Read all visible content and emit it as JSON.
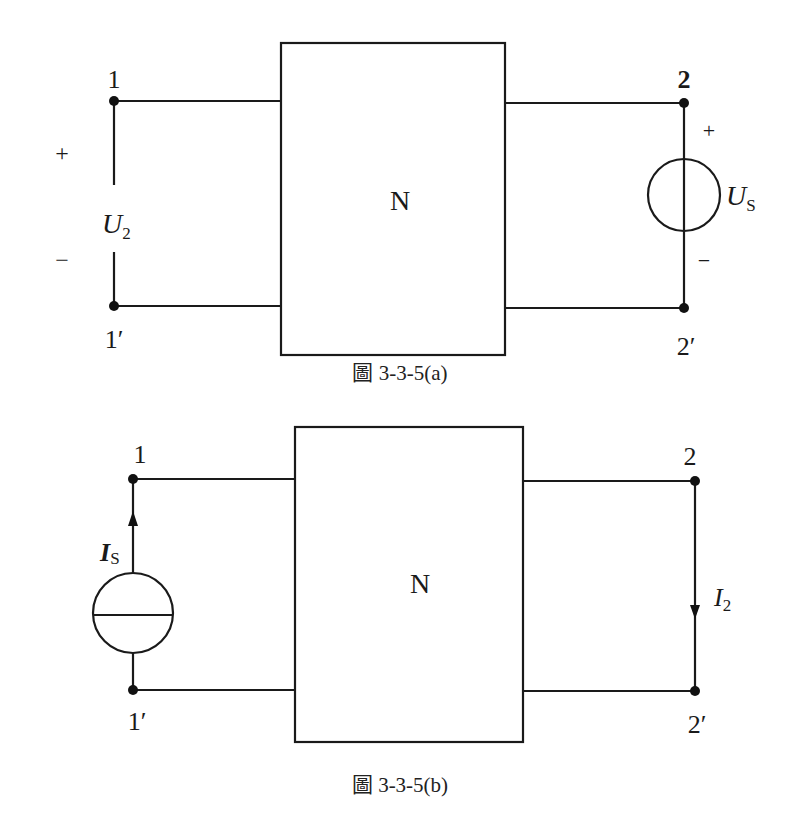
{
  "figures": [
    {
      "id": "a",
      "caption": "圖 3-3-5(a)",
      "network_label": "N",
      "terminals": {
        "left_top": "1",
        "left_bottom": "1′",
        "right_top": "2",
        "right_bottom": "2′"
      },
      "left_port": {
        "type": "open-circuit voltage",
        "plus": "+",
        "minus": "−",
        "symbol": "U",
        "subscript": "2"
      },
      "right_port": {
        "type": "voltage source",
        "plus": "+",
        "minus": "−",
        "symbol": "U",
        "subscript": "S"
      }
    },
    {
      "id": "b",
      "caption": "圖 3-3-5(b)",
      "network_label": "N",
      "terminals": {
        "left_top": "1",
        "left_bottom": "1′",
        "right_top": "2",
        "right_bottom": "2′"
      },
      "left_port": {
        "type": "current source",
        "symbol": "I",
        "subscript": "S",
        "direction": "up"
      },
      "right_port": {
        "type": "short-circuit current",
        "symbol": "I",
        "subscript": "2",
        "direction": "down"
      }
    }
  ],
  "colors": {
    "line": "#1a1a1a",
    "background": "#ffffff"
  }
}
